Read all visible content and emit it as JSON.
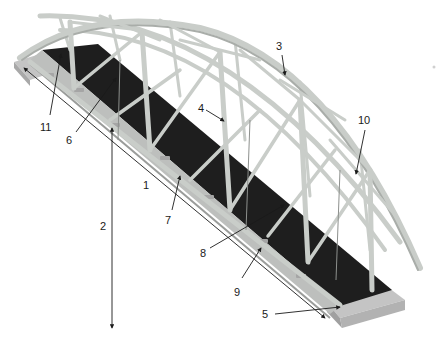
{
  "figure": {
    "colors": {
      "background": "#ffffff",
      "steel": "#c9cdc9",
      "steel_shadow": "#a9ada9",
      "deck": "#1e1e1e",
      "abutment": "#bfbfbf",
      "leader_line": "#1a1a1a"
    }
  },
  "callouts": [
    {
      "id": "1",
      "label": "1"
    },
    {
      "id": "2",
      "label": "2"
    },
    {
      "id": "3",
      "label": "3"
    },
    {
      "id": "4",
      "label": "4"
    },
    {
      "id": "5",
      "label": "5"
    },
    {
      "id": "6",
      "label": "6"
    },
    {
      "id": "7",
      "label": "7"
    },
    {
      "id": "8",
      "label": "8"
    },
    {
      "id": "9",
      "label": "9"
    },
    {
      "id": "10",
      "label": "10"
    },
    {
      "id": "11",
      "label": "11"
    }
  ]
}
